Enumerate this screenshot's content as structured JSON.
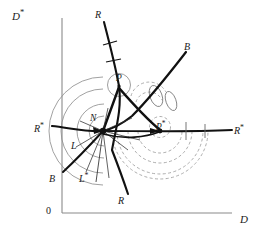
{
  "figure": {
    "type": "phase-diagram",
    "background": "#ffffff",
    "width": 261,
    "height": 235,
    "axes": {
      "x_label": "D",
      "y_label_base": "D",
      "y_label_star": "*",
      "origin_label": "0",
      "x_axis": {
        "x1": 62,
        "y1": 213,
        "x2": 232,
        "y2": 213
      },
      "y_axis": {
        "x1": 62,
        "y1": 213,
        "x2": 62,
        "y2": 18
      },
      "axis_color": "#8a8a8a"
    },
    "labels": [
      {
        "id": "y-axis-label",
        "text": "D",
        "star": true,
        "x": 12,
        "y": 10,
        "cls": "ax-lbl"
      },
      {
        "id": "x-axis-label",
        "text": "D",
        "star": false,
        "x": 238,
        "y": 216,
        "cls": "ax-lbl"
      },
      {
        "id": "origin-label",
        "text": "0",
        "star": false,
        "x": 46,
        "y": 206,
        "cls": "zero"
      },
      {
        "id": "node-n",
        "text": "N",
        "star": false,
        "x": 91,
        "y": 116,
        "cls": "node-lbl"
      },
      {
        "id": "node-p",
        "text": "P",
        "star": false,
        "x": 117,
        "y": 76,
        "cls": "node-lbl"
      },
      {
        "id": "node-p-star",
        "text": "P",
        "star": true,
        "x": 157,
        "y": 122,
        "cls": "node-lbl"
      },
      {
        "id": "curve-r-top",
        "text": "R",
        "star": false,
        "x": 96,
        "y": 12,
        "cls": "curve-lbl"
      },
      {
        "id": "curve-r-bottom",
        "text": "R",
        "star": false,
        "x": 119,
        "y": 198,
        "cls": "curve-lbl"
      },
      {
        "id": "curve-r-star-left",
        "text": "R",
        "star": true,
        "x": 36,
        "y": 124,
        "cls": "curve-lbl"
      },
      {
        "id": "curve-r-star-right",
        "text": "R",
        "star": true,
        "x": 236,
        "y": 126,
        "cls": "curve-lbl"
      },
      {
        "id": "curve-b-top",
        "text": "B",
        "star": false,
        "x": 185,
        "y": 44,
        "cls": "curve-lbl"
      },
      {
        "id": "curve-b-bottom",
        "text": "B",
        "star": false,
        "x": 50,
        "y": 176,
        "cls": "curve-lbl"
      },
      {
        "id": "curve-l",
        "text": "L",
        "star": false,
        "x": 72,
        "y": 143,
        "cls": "curve-lbl"
      },
      {
        "id": "curve-l-star",
        "text": "L",
        "star": true,
        "x": 80,
        "y": 174,
        "cls": "curve-lbl"
      }
    ],
    "colors": {
      "ink": "#111111",
      "axis": "#8a8a8a",
      "arc_solid": "#8c8c8c",
      "arc_dashed": "#9a9a9a",
      "thin": "#3a3a3a"
    },
    "nodes": {
      "N": {
        "x": 103,
        "y": 131
      },
      "P": {
        "x": 119,
        "y": 86
      },
      "P_star": {
        "x": 160,
        "y": 131
      }
    },
    "arc_families": {
      "solid_centered_N": {
        "style": "solid",
        "radii": [
          14,
          26,
          40,
          52
        ],
        "center": "N"
      },
      "dashed_centered_P_star": {
        "style": "dashed",
        "radii": [
          14,
          24,
          36,
          46
        ],
        "center": "P_star"
      },
      "small_circle_P": {
        "style": "solid",
        "radius": 11,
        "center": "P"
      },
      "small_circle_P_star": {
        "style": "dashed",
        "radius": 10,
        "center": "P_star"
      }
    }
  }
}
